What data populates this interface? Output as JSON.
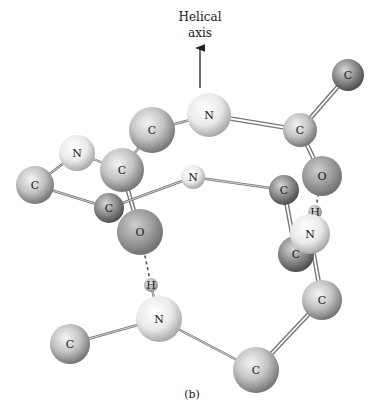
{
  "figure": {
    "axis_label_line1": "Helical",
    "axis_label_line2": "axis",
    "caption": "(b)"
  },
  "colors": {
    "carbon": "#9a9a9a",
    "carbon_dark": "#6e6e6e",
    "nitrogen": "#e6e6e6",
    "oxygen": "#8c8c8c",
    "hydrogen": "#bdbdbd",
    "bond": "#777777"
  },
  "atoms": [
    {
      "id": "c1",
      "el": "C",
      "x": 348,
      "y": 75,
      "r": 16,
      "shade": "dark"
    },
    {
      "id": "n1",
      "el": "N",
      "x": 209,
      "y": 115,
      "r": 22,
      "shade": "light"
    },
    {
      "id": "c2",
      "el": "C",
      "x": 300,
      "y": 130,
      "r": 17,
      "shade": "mid"
    },
    {
      "id": "c3",
      "el": "C",
      "x": 152,
      "y": 130,
      "r": 23,
      "shade": "mid"
    },
    {
      "id": "n2",
      "el": "N",
      "x": 77,
      "y": 153,
      "r": 18,
      "shade": "light"
    },
    {
      "id": "c4",
      "el": "C",
      "x": 122,
      "y": 170,
      "r": 22,
      "shade": "mid"
    },
    {
      "id": "o1",
      "el": "O",
      "x": 322,
      "y": 176,
      "r": 20,
      "shade": "oxy"
    },
    {
      "id": "n3",
      "el": "N",
      "x": 193,
      "y": 177,
      "r": 12,
      "shade": "light"
    },
    {
      "id": "c5",
      "el": "C",
      "x": 35,
      "y": 185,
      "r": 19,
      "shade": "mid"
    },
    {
      "id": "c6",
      "el": "C",
      "x": 284,
      "y": 190,
      "r": 15,
      "shade": "dark"
    },
    {
      "id": "c7",
      "el": "C",
      "x": 109,
      "y": 208,
      "r": 15,
      "shade": "dark"
    },
    {
      "id": "o2",
      "el": "O",
      "x": 140,
      "y": 232,
      "r": 23,
      "shade": "oxy"
    },
    {
      "id": "h1",
      "el": "H",
      "x": 315,
      "y": 212,
      "r": 7,
      "shade": "h"
    },
    {
      "id": "c8",
      "el": "C",
      "x": 296,
      "y": 254,
      "r": 18,
      "shade": "dark"
    },
    {
      "id": "n4",
      "el": "N",
      "x": 310,
      "y": 234,
      "r": 20,
      "shade": "light"
    },
    {
      "id": "h2",
      "el": "H",
      "x": 151,
      "y": 285,
      "r": 7,
      "shade": "h"
    },
    {
      "id": "n5",
      "el": "N",
      "x": 159,
      "y": 319,
      "r": 23,
      "shade": "light"
    },
    {
      "id": "c9",
      "el": "C",
      "x": 322,
      "y": 300,
      "r": 20,
      "shade": "mid"
    },
    {
      "id": "c10",
      "el": "C",
      "x": 70,
      "y": 344,
      "r": 20,
      "shade": "mid"
    },
    {
      "id": "c11",
      "el": "C",
      "x": 256,
      "y": 370,
      "r": 23,
      "shade": "mid"
    }
  ],
  "bonds": [
    [
      "c1",
      "c2",
      "double"
    ],
    [
      "n1",
      "c2",
      "double"
    ],
    [
      "c3",
      "n1",
      "single"
    ],
    [
      "c4",
      "c3",
      "single"
    ],
    [
      "n2",
      "c4",
      "single"
    ],
    [
      "c5",
      "n2",
      "single"
    ],
    [
      "c5",
      "c7",
      "single"
    ],
    [
      "c4",
      "o2",
      "double"
    ],
    [
      "c7",
      "n3",
      "single"
    ],
    [
      "n3",
      "c6",
      "single"
    ],
    [
      "c2",
      "o1",
      "double"
    ],
    [
      "c6",
      "c8",
      "double"
    ],
    [
      "n4",
      "c9",
      "double"
    ],
    [
      "c9",
      "c11",
      "double"
    ],
    [
      "n5",
      "c11",
      "single"
    ],
    [
      "c10",
      "n5",
      "single"
    ],
    [
      "h2",
      "n5",
      "single"
    ],
    [
      "h1",
      "n4",
      "single"
    ]
  ],
  "hbonds": [
    [
      "o2",
      "h2"
    ],
    [
      "o1",
      "h1"
    ]
  ]
}
